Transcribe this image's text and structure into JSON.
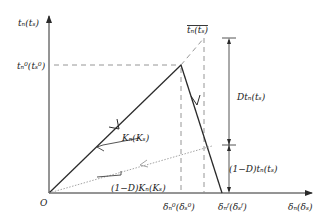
{
  "diagram": {
    "colors": {
      "line": "#2a2a2a",
      "dashed": "#8a8a8a",
      "dotted": "#9a9a9a",
      "background": "#ffffff"
    },
    "axes": {
      "y_label": "tₙ(tₛ)",
      "x_label": "δₙ(δₛ)",
      "origin_label": "O"
    },
    "labels": {
      "peak_traction": "tₙ⁰(tₛ⁰)",
      "max_traction_bar": "tₙ(tₛ)",
      "damage_traction": "Dtₙ(tₛ)",
      "residual_traction": "(1−D)tₙ(tₛ)",
      "stiffness": "Kₙ(Kₛ)",
      "degraded_stiffness": "(1−D)Kₙ(Kₛ)",
      "delta_onset": "δₙ⁰(δₛ⁰)",
      "delta_final": "δₙᶠ(δₛᶠ)"
    }
  }
}
